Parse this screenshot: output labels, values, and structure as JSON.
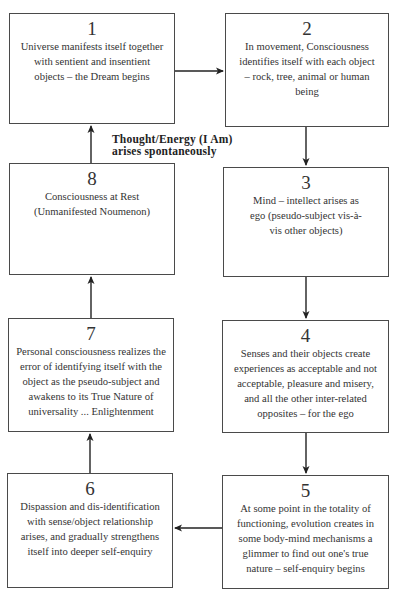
{
  "diagram": {
    "type": "cycle-flowchart",
    "boxes": [
      {
        "number": "1",
        "text": "Universe manifests itself together with sentient and insentient objects – the Dream begins"
      },
      {
        "number": "2",
        "text": "In movement, Consciousness identifies itself with each object – rock, tree, animal or human being"
      },
      {
        "number": "3",
        "text": "Mind – intellect arises as ego (pseudo-subject vis-à-vis other objects)"
      },
      {
        "number": "4",
        "text": "Senses and their objects create experiences as acceptable and not acceptable, pleasure and misery, and all the other inter-related opposites – for the ego"
      },
      {
        "number": "5",
        "text": "At some point in the totality of functioning, evolution creates in some body-mind mechanisms a glimmer to find out one's true nature – self-enquiry begins"
      },
      {
        "number": "6",
        "text": "Dispassion and dis-identification with sense/object relationship arises, and gradually strengthens itself into deeper self-enquiry"
      },
      {
        "number": "7",
        "text": "Personal consciousness realizes the error of identifying itself with the object as the pseudo-subject and awakens to its True Nature of universality ... Enlightenment"
      },
      {
        "number": "8",
        "text": "Consciousness at Rest (Unmanifested Noumenon)"
      }
    ],
    "edge_label": "Thought/Energy (I Am)\narises spontaneously",
    "edges": [
      {
        "from": "1",
        "to": "2"
      },
      {
        "from": "2",
        "to": "3"
      },
      {
        "from": "3",
        "to": "4"
      },
      {
        "from": "4",
        "to": "5"
      },
      {
        "from": "5",
        "to": "6"
      },
      {
        "from": "6",
        "to": "7"
      },
      {
        "from": "7",
        "to": "8"
      },
      {
        "from": "8",
        "to": "1",
        "label": "Thought/Energy (I Am) arises spontaneously"
      }
    ]
  }
}
